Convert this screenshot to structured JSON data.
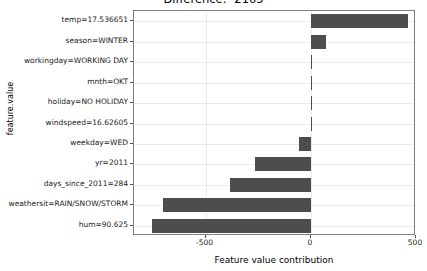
{
  "chart_data": {
    "type": "bar",
    "orientation": "horizontal",
    "title": "Difference: -2105",
    "xlabel": "Feature value contribution",
    "ylabel": "feature.value",
    "xlim": [
      -840,
      500
    ],
    "xticks": [
      -500,
      0,
      500
    ],
    "xtick_labels": [
      "-500",
      "0",
      "500"
    ],
    "grid": true,
    "legend": "none",
    "bar_color": "#4d4d4d",
    "panel_background": "#ffffff",
    "grid_color": "#ebebeb",
    "categories": [
      "temp=17.536651",
      "season=WINTER",
      "workingday=WORKING DAY",
      "mnth=OKT",
      "holiday=NO HOLIDAY",
      "windspeed=16.62605",
      "weekday=WED",
      "yr=2011",
      "days_since_2011=284",
      "weathersit=RAIN/SNOW/STORM",
      "hum=90.625"
    ],
    "values": [
      460,
      72,
      4,
      0,
      0,
      0,
      -55,
      -265,
      -385,
      -700,
      -755
    ]
  }
}
